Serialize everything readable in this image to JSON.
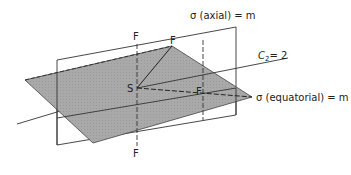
{
  "diagram": {
    "labels": {
      "sigma_axial": "σ (axial) = m",
      "sigma_equatorial": "σ (equatorial) = m",
      "c2_axis": "C",
      "c2_sub": "2",
      "c2_value": "= 2",
      "center": "S",
      "f_top": "F",
      "f_upper": "F",
      "f_right": "F",
      "f_bottom": "F"
    },
    "colors": {
      "plane_fill": "#a8a8a8",
      "line": "#333333",
      "background": "#ffffff"
    }
  }
}
